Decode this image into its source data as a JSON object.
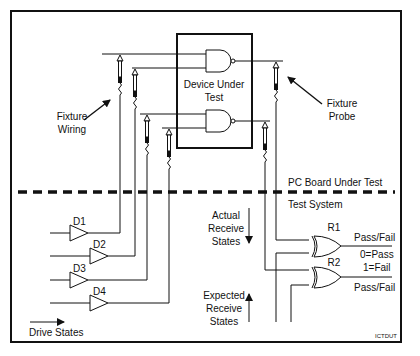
{
  "diagram": {
    "regions": {
      "top": "PC Board Under Test",
      "bottom": "Test System"
    },
    "device": {
      "label_line1": "Device Under",
      "label_line2": "Test",
      "gates": [
        "NAND",
        "NAND"
      ]
    },
    "callouts": {
      "fixture_wiring_1": "Fixture",
      "fixture_wiring_2": "Wiring",
      "fixture_probe_1": "Fixture",
      "fixture_probe_2": "Probe"
    },
    "drivers": [
      "D1",
      "D2",
      "D3",
      "D4"
    ],
    "drive_states": "Drive States",
    "actual": {
      "l1": "Actual",
      "l2": "Receive",
      "l3": "States"
    },
    "expected": {
      "l1": "Expected",
      "l2": "Receive",
      "l3": "States"
    },
    "receivers": [
      "R1",
      "R2"
    ],
    "pass_fail_1": "Pass/Fail",
    "pass_fail_2": "Pass/Fail",
    "legend_pass": "0=Pass",
    "legend_fail": "1=Fail",
    "figure_id": "ICTDUT"
  }
}
